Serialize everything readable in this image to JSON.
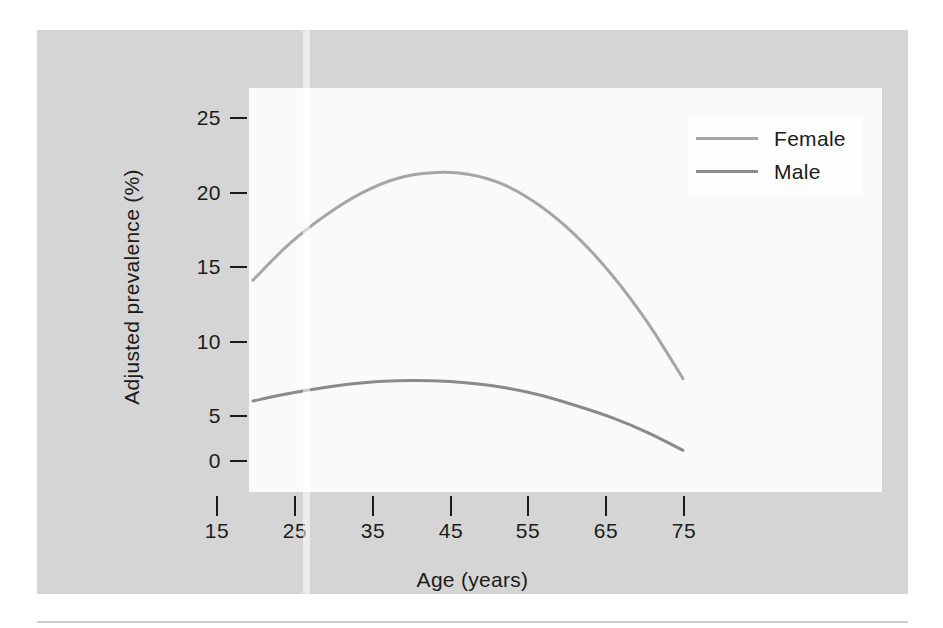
{
  "figure": {
    "background_color": "#d5d5d5",
    "plot_background_color": "#fafafa"
  },
  "chart_data": {
    "type": "line",
    "title": "",
    "xlabel": "Age (years)",
    "ylabel": "Adjusted prevalence (%)",
    "xlim": [
      15,
      75
    ],
    "ylim": [
      0,
      27
    ],
    "xticks": [
      15,
      25,
      35,
      45,
      55,
      65,
      75
    ],
    "yticks": [
      0,
      5,
      10,
      15,
      20,
      25
    ],
    "grid": false,
    "legend_position": "top-right",
    "x": [
      15,
      20,
      25,
      30,
      35,
      40,
      45,
      50,
      55,
      60,
      65,
      70,
      75
    ],
    "series": [
      {
        "name": "Female",
        "color": "#a6a6a6",
        "values": [
          14.2,
          16.6,
          18.5,
          20.0,
          21.0,
          21.4,
          21.3,
          20.6,
          19.2,
          17.2,
          14.6,
          11.4,
          7.6
        ]
      },
      {
        "name": "Male",
        "color": "#8a8a8a",
        "values": [
          6.1,
          6.6,
          7.0,
          7.3,
          7.45,
          7.45,
          7.3,
          7.0,
          6.5,
          5.8,
          5.0,
          4.0,
          2.8
        ]
      }
    ]
  },
  "axes": {
    "y_tick_labels": [
      "25",
      "20",
      "15",
      "10",
      "5",
      "0"
    ],
    "x_tick_labels": [
      "15",
      "25",
      "35",
      "45",
      "55",
      "65",
      "75"
    ],
    "y_title": "Adjusted prevalence (%)",
    "x_title": "Age (years)"
  },
  "legend": {
    "entries": [
      {
        "label": "Female",
        "color": "#a6a6a6"
      },
      {
        "label": "Male",
        "color": "#8a8a8a"
      }
    ]
  }
}
